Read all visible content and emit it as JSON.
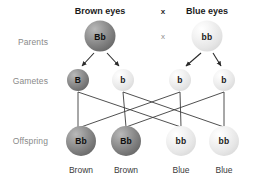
{
  "diagram": {
    "row_labels": [
      {
        "id": "parents",
        "text": "Parents",
        "x": 48,
        "y": 42
      },
      {
        "id": "gametes",
        "text": "Gametes",
        "x": 48,
        "y": 81
      },
      {
        "id": "offspring",
        "text": "Offspring",
        "x": 48,
        "y": 141
      }
    ],
    "headers": [
      {
        "id": "brown-eyes",
        "text": "Brown eyes",
        "x": 100,
        "y": 6
      },
      {
        "id": "blue-eyes",
        "text": "Blue eyes",
        "x": 207,
        "y": 6
      }
    ],
    "cross_symbols": [
      {
        "id": "cross-top",
        "text": "x",
        "x": 163,
        "y": 11,
        "style": "bold"
      },
      {
        "id": "cross-bottom",
        "text": "x",
        "x": 163,
        "y": 36,
        "style": "faint"
      }
    ],
    "parents": [
      {
        "id": "parent-brown",
        "genotype": "Bb",
        "shade": "dark",
        "x": 100,
        "y": 36,
        "size": 31
      },
      {
        "id": "parent-blue",
        "genotype": "bb",
        "shade": "light",
        "x": 207,
        "y": 36,
        "size": 31
      }
    ],
    "gametes": [
      {
        "id": "gamete-B",
        "genotype": "B",
        "shade": "dark",
        "x": 78,
        "y": 80,
        "size": 22
      },
      {
        "id": "gamete-b1",
        "genotype": "b",
        "shade": "light",
        "x": 123,
        "y": 80,
        "size": 22
      },
      {
        "id": "gamete-b2",
        "genotype": "b",
        "shade": "light",
        "x": 180,
        "y": 80,
        "size": 22
      },
      {
        "id": "gamete-b3",
        "genotype": "b",
        "shade": "light",
        "x": 224,
        "y": 80,
        "size": 22
      }
    ],
    "offspring": [
      {
        "id": "offspring-1",
        "genotype": "Bb",
        "shade": "dark",
        "phenotype": "Brown",
        "x": 81,
        "y": 141,
        "size": 30
      },
      {
        "id": "offspring-2",
        "genotype": "Bb",
        "shade": "dark",
        "phenotype": "Brown",
        "x": 126,
        "y": 141,
        "size": 30
      },
      {
        "id": "offspring-3",
        "genotype": "bb",
        "shade": "light",
        "phenotype": "Blue",
        "x": 181,
        "y": 141,
        "size": 30
      },
      {
        "id": "offspring-4",
        "genotype": "bb",
        "shade": "light",
        "phenotype": "Blue",
        "x": 224,
        "y": 141,
        "size": 30
      }
    ],
    "phenotype_label_y": 165,
    "colors": {
      "dominant_fill": "#7e7e7e",
      "recessive_fill": "#e6e6e6",
      "line": "#3c3c3c",
      "row_label_text": "#8a8a8a",
      "header_text": "#1b1b1b",
      "background": "#ffffff"
    },
    "arrows": [
      {
        "id": "arrow-parent-brown-left",
        "x1": 94,
        "y1": 53,
        "x2": 82,
        "y2": 66
      },
      {
        "id": "arrow-parent-brown-right",
        "x1": 107,
        "y1": 53,
        "x2": 119,
        "y2": 66
      },
      {
        "id": "arrow-parent-blue-left",
        "x1": 201,
        "y1": 53,
        "x2": 186,
        "y2": 66
      },
      {
        "id": "arrow-parent-blue-right",
        "x1": 213,
        "y1": 53,
        "x2": 221,
        "y2": 66
      }
    ],
    "connectors": [
      {
        "id": "connector-B-to-off1",
        "points": "78,92 78,127"
      },
      {
        "id": "connector-B-to-off3",
        "points": "78,92 181,127"
      },
      {
        "id": "connector-b1-to-off2",
        "points": "123,92 126,127"
      },
      {
        "id": "connector-b1-to-off4",
        "points": "123,92 224,127"
      },
      {
        "id": "connector-b2-to-off3",
        "points": "180,92 181,127"
      },
      {
        "id": "connector-b2-to-off1",
        "points": "180,92 81,127"
      },
      {
        "id": "connector-b3-to-off4",
        "points": "224,92 224,127"
      },
      {
        "id": "connector-b3-to-off2",
        "points": "224,92 126,127"
      }
    ]
  }
}
